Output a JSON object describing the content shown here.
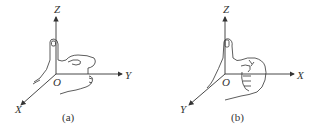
{
  "figure": {
    "panels": [
      {
        "id": "a",
        "caption": "(a)",
        "axes": {
          "z": "Z",
          "y": "Y",
          "x": "X",
          "origin": "O"
        },
        "description": "Left-hand rule: thumb points along Z, fingers curl from X toward Y"
      },
      {
        "id": "b",
        "caption": "(b)",
        "axes": {
          "z": "Z",
          "x": "X",
          "y": "Y",
          "origin": "O"
        },
        "description": "Right-hand rule: thumb points along Z, fingers curl from X toward Y"
      }
    ],
    "colors": {
      "line": "#333333",
      "background": "#ffffff"
    }
  }
}
